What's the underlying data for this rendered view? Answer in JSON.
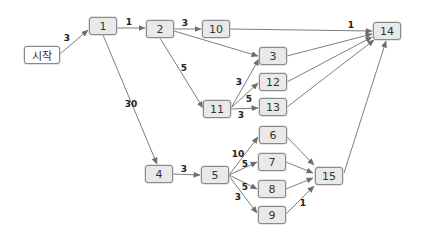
{
  "diagram": {
    "type": "network-diagram",
    "style": {
      "node_fill": "#e9e9e9",
      "start_fill": "#ffffff",
      "node_border": "#8a8a8a",
      "edge_color": "#6e6e6e"
    },
    "nodes": [
      {
        "id": "start",
        "label": "시작",
        "x": 24,
        "y": 46,
        "w": 36,
        "h": 18,
        "start": true
      },
      {
        "id": "1",
        "label": "1",
        "x": 89,
        "y": 17,
        "w": 28,
        "h": 18
      },
      {
        "id": "2",
        "label": "2",
        "x": 146,
        "y": 20,
        "w": 28,
        "h": 18
      },
      {
        "id": "10",
        "label": "10",
        "x": 202,
        "y": 20,
        "w": 28,
        "h": 18
      },
      {
        "id": "14",
        "label": "14",
        "x": 373,
        "y": 22,
        "w": 28,
        "h": 18
      },
      {
        "id": "3",
        "label": "3",
        "x": 259,
        "y": 47,
        "w": 28,
        "h": 18
      },
      {
        "id": "12",
        "label": "12",
        "x": 259,
        "y": 73,
        "w": 28,
        "h": 18
      },
      {
        "id": "13",
        "label": "13",
        "x": 259,
        "y": 98,
        "w": 28,
        "h": 18
      },
      {
        "id": "11",
        "label": "11",
        "x": 203,
        "y": 100,
        "w": 28,
        "h": 18
      },
      {
        "id": "6",
        "label": "6",
        "x": 259,
        "y": 126,
        "w": 28,
        "h": 18
      },
      {
        "id": "7",
        "label": "7",
        "x": 258,
        "y": 153,
        "w": 28,
        "h": 18
      },
      {
        "id": "8",
        "label": "8",
        "x": 258,
        "y": 180,
        "w": 28,
        "h": 18
      },
      {
        "id": "9",
        "label": "9",
        "x": 258,
        "y": 206,
        "w": 28,
        "h": 18
      },
      {
        "id": "4",
        "label": "4",
        "x": 145,
        "y": 165,
        "w": 28,
        "h": 18
      },
      {
        "id": "5",
        "label": "5",
        "x": 201,
        "y": 166,
        "w": 28,
        "h": 18
      },
      {
        "id": "15",
        "label": "15",
        "x": 315,
        "y": 167,
        "w": 28,
        "h": 18
      }
    ],
    "edges": [
      {
        "from": "start",
        "to": "1",
        "label": "3",
        "x1": 60,
        "y1": 54,
        "x2": 88,
        "y2": 30,
        "lx": 67,
        "ly": 38
      },
      {
        "from": "1",
        "to": "2",
        "label": "1",
        "x1": 117,
        "y1": 28,
        "x2": 145,
        "y2": 28,
        "lx": 129,
        "ly": 22
      },
      {
        "from": "1",
        "to": "4",
        "label": "30",
        "x1": 103,
        "y1": 35,
        "x2": 157,
        "y2": 164,
        "lx": 131,
        "ly": 104
      },
      {
        "from": "2",
        "to": "10",
        "label": "3",
        "x1": 174,
        "y1": 29,
        "x2": 201,
        "y2": 29,
        "lx": 185,
        "ly": 23
      },
      {
        "from": "2",
        "to": "3",
        "label": "",
        "x1": 174,
        "y1": 31,
        "x2": 258,
        "y2": 56,
        "lx": 0,
        "ly": 0
      },
      {
        "from": "2",
        "to": "11",
        "label": "5",
        "x1": 160,
        "y1": 38,
        "x2": 203,
        "y2": 108,
        "lx": 184,
        "ly": 68
      },
      {
        "from": "10",
        "to": "14",
        "label": "1",
        "x1": 230,
        "y1": 29,
        "x2": 372,
        "y2": 31,
        "lx": 351,
        "ly": 25
      },
      {
        "from": "11",
        "to": "3",
        "label": "3",
        "x1": 231,
        "y1": 108,
        "x2": 259,
        "y2": 59,
        "lx": 239,
        "ly": 82
      },
      {
        "from": "11",
        "to": "12",
        "label": "5",
        "x1": 231,
        "y1": 108,
        "x2": 258,
        "y2": 83,
        "lx": 249,
        "ly": 99
      },
      {
        "from": "11",
        "to": "13",
        "label": "3",
        "x1": 231,
        "y1": 109,
        "x2": 258,
        "y2": 108,
        "lx": 241,
        "ly": 115
      },
      {
        "from": "3",
        "to": "14",
        "label": "",
        "x1": 287,
        "y1": 56,
        "x2": 372,
        "y2": 34,
        "lx": 0,
        "ly": 0
      },
      {
        "from": "12",
        "to": "14",
        "label": "",
        "x1": 287,
        "y1": 82,
        "x2": 372,
        "y2": 37,
        "lx": 0,
        "ly": 0
      },
      {
        "from": "13",
        "to": "14",
        "label": "",
        "x1": 287,
        "y1": 107,
        "x2": 374,
        "y2": 40,
        "lx": 0,
        "ly": 0
      },
      {
        "from": "15",
        "to": "14",
        "label": "",
        "x1": 344,
        "y1": 173,
        "x2": 386,
        "y2": 41,
        "lx": 0,
        "ly": 0
      },
      {
        "from": "4",
        "to": "5",
        "label": "3",
        "x1": 173,
        "y1": 174,
        "x2": 200,
        "y2": 175,
        "lx": 184,
        "ly": 169
      },
      {
        "from": "5",
        "to": "6",
        "label": "10",
        "x1": 229,
        "y1": 175,
        "x2": 258,
        "y2": 137,
        "lx": 238,
        "ly": 154
      },
      {
        "from": "5",
        "to": "7",
        "label": "5",
        "x1": 229,
        "y1": 175,
        "x2": 257,
        "y2": 162,
        "lx": 245,
        "ly": 164
      },
      {
        "from": "5",
        "to": "8",
        "label": "5",
        "x1": 229,
        "y1": 175,
        "x2": 257,
        "y2": 189,
        "lx": 245,
        "ly": 187
      },
      {
        "from": "5",
        "to": "9",
        "label": "3",
        "x1": 229,
        "y1": 176,
        "x2": 257,
        "y2": 213,
        "lx": 238,
        "ly": 197
      },
      {
        "from": "6",
        "to": "15",
        "label": "",
        "x1": 287,
        "y1": 137,
        "x2": 314,
        "y2": 165,
        "lx": 0,
        "ly": 0
      },
      {
        "from": "7",
        "to": "15",
        "label": "",
        "x1": 286,
        "y1": 162,
        "x2": 313,
        "y2": 173,
        "lx": 0,
        "ly": 0
      },
      {
        "from": "8",
        "to": "15",
        "label": "",
        "x1": 286,
        "y1": 189,
        "x2": 313,
        "y2": 178,
        "lx": 0,
        "ly": 0
      },
      {
        "from": "9",
        "to": "15",
        "label": "1",
        "x1": 286,
        "y1": 214,
        "x2": 314,
        "y2": 186,
        "lx": 303,
        "ly": 203
      }
    ]
  }
}
